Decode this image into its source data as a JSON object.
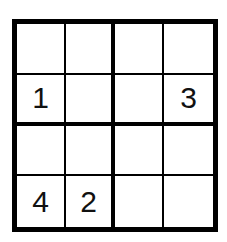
{
  "puzzle": {
    "type": "sudoku-4x4",
    "rows": [
      [
        "",
        "",
        "",
        ""
      ],
      [
        "1",
        "",
        "",
        "3"
      ],
      [
        "",
        "",
        "",
        ""
      ],
      [
        "4",
        "2",
        "",
        ""
      ]
    ]
  }
}
